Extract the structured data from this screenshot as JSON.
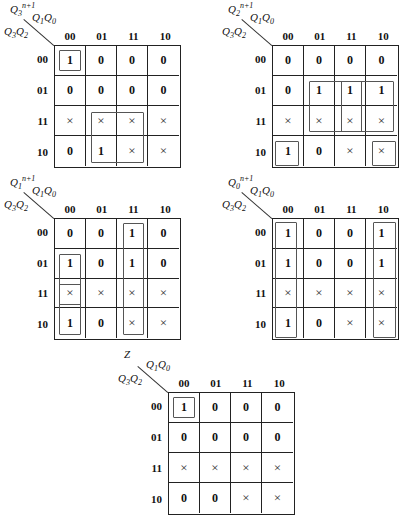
{
  "columns": [
    "00",
    "01",
    "11",
    "10"
  ],
  "rows": [
    "00",
    "01",
    "11",
    "10"
  ],
  "col_var": "Q1Q0",
  "row_var": "Q3Q2",
  "maps": [
    {
      "id": "q3",
      "output_label": "Q3",
      "output_sup": "n+1",
      "grid": {
        "x": 54,
        "y": 45,
        "w": 127,
        "h": 123
      },
      "cells": [
        [
          "1",
          "0",
          "0",
          "0"
        ],
        [
          "0",
          "0",
          "0",
          "0"
        ],
        [
          "×",
          "×",
          "×",
          "×"
        ],
        [
          "0",
          "1",
          "×",
          "×"
        ]
      ],
      "loops": [
        {
          "r0": 0,
          "c0": 0,
          "r1": 0,
          "c1": 0
        },
        {
          "r0": 2,
          "c0": 1,
          "r1": 3,
          "c1": 2
        }
      ]
    },
    {
      "id": "q2",
      "output_label": "Q2",
      "output_sup": "n+1",
      "grid": {
        "x": 272,
        "y": 45,
        "w": 127,
        "h": 123
      },
      "cells": [
        [
          "0",
          "0",
          "0",
          "0"
        ],
        [
          "0",
          "1",
          "1",
          "1"
        ],
        [
          "×",
          "×",
          "×",
          "×"
        ],
        [
          "1",
          "0",
          "×",
          "×"
        ]
      ],
      "loops": [
        {
          "r0": 1,
          "c0": 1,
          "r1": 2,
          "c1": 2
        },
        {
          "r0": 1,
          "c0": 2,
          "r1": 2,
          "c1": 3
        },
        {
          "r0": 3,
          "c0": 0,
          "r1": 3,
          "c1": 0,
          "wrap": "left"
        },
        {
          "r0": 3,
          "c0": 3,
          "r1": 3,
          "c1": 3,
          "wrap": "right"
        }
      ]
    },
    {
      "id": "q1",
      "output_label": "Q1",
      "output_sup": "n+1",
      "grid": {
        "x": 54,
        "y": 218,
        "w": 127,
        "h": 122
      },
      "cells": [
        [
          "0",
          "0",
          "1",
          "0"
        ],
        [
          "1",
          "0",
          "1",
          "0"
        ],
        [
          "×",
          "×",
          "×",
          "×"
        ],
        [
          "1",
          "0",
          "×",
          "×"
        ]
      ],
      "loops": [
        {
          "r0": 0,
          "c0": 2,
          "r1": 3,
          "c1": 2
        },
        {
          "r0": 1,
          "c0": 0,
          "r1": 2,
          "c1": 0
        },
        {
          "r0": 2,
          "c0": 0,
          "r1": 3,
          "c1": 0
        }
      ]
    },
    {
      "id": "q0",
      "output_label": "Q0",
      "output_sup": "n+1",
      "grid": {
        "x": 272,
        "y": 218,
        "w": 127,
        "h": 122
      },
      "cells": [
        [
          "1",
          "0",
          "0",
          "1"
        ],
        [
          "1",
          "0",
          "0",
          "1"
        ],
        [
          "×",
          "×",
          "×",
          "×"
        ],
        [
          "1",
          "0",
          "×",
          "×"
        ]
      ],
      "loops": [
        {
          "r0": 0,
          "c0": 0,
          "r1": 3,
          "c1": 0,
          "wrap": "left"
        },
        {
          "r0": 0,
          "c0": 3,
          "r1": 3,
          "c1": 3,
          "wrap": "right"
        }
      ]
    },
    {
      "id": "z",
      "output_label": "Z",
      "output_sup": "",
      "grid": {
        "x": 168,
        "y": 392,
        "w": 127,
        "h": 123
      },
      "cells": [
        [
          "1",
          "0",
          "0",
          "0"
        ],
        [
          "0",
          "0",
          "0",
          "0"
        ],
        [
          "×",
          "×",
          "×",
          "×"
        ],
        [
          "0",
          "0",
          "×",
          "×"
        ]
      ],
      "loops": [
        {
          "r0": 0,
          "c0": 0,
          "r1": 0,
          "c1": 0
        }
      ]
    }
  ]
}
